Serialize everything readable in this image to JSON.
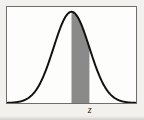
{
  "figure": {
    "name": "normal-distribution-shaded-area",
    "background_color": "#f3f1ee",
    "frame": {
      "border_color": "#6e6e6e",
      "fill_color": "#fdfdfc",
      "border_width_px": 1
    },
    "axis_label": "z"
  },
  "chart_data": {
    "type": "area",
    "title": "",
    "subtitle": "",
    "xlabel": "",
    "ylabel": "",
    "legend": [],
    "grid": false,
    "curve_color": "#111111",
    "curve_width_px": 2,
    "shade_color": "#8a8a8a",
    "shade_label": "z",
    "xlim": [
      -3.6,
      3.6
    ],
    "ylim": [
      0,
      0.42
    ],
    "shade_region": {
      "from": 0,
      "to": 1.0,
      "from_label": "",
      "to_label": "z"
    },
    "annotations": [
      {
        "text": "z",
        "x": 1.0,
        "y": 0,
        "position": "below-axis"
      }
    ],
    "x": [
      -3.6,
      -3.4,
      -3.2,
      -3.0,
      -2.8,
      -2.6,
      -2.4,
      -2.2,
      -2.0,
      -1.8,
      -1.6,
      -1.4,
      -1.2,
      -1.0,
      -0.8,
      -0.6,
      -0.4,
      -0.2,
      0.0,
      0.2,
      0.4,
      0.6,
      0.8,
      1.0,
      1.2,
      1.4,
      1.6,
      1.8,
      2.0,
      2.2,
      2.4,
      2.6,
      2.8,
      3.0,
      3.2,
      3.4,
      3.6
    ],
    "values": [
      0.0006,
      0.0012,
      0.0024,
      0.0044,
      0.0079,
      0.0136,
      0.0224,
      0.0355,
      0.054,
      0.079,
      0.1109,
      0.1497,
      0.1942,
      0.242,
      0.2897,
      0.3332,
      0.3683,
      0.391,
      0.3989,
      0.391,
      0.3683,
      0.3332,
      0.2897,
      0.242,
      0.1942,
      0.1497,
      0.1109,
      0.079,
      0.054,
      0.0355,
      0.0224,
      0.0136,
      0.0079,
      0.0044,
      0.0024,
      0.0012,
      0.0006
    ]
  }
}
